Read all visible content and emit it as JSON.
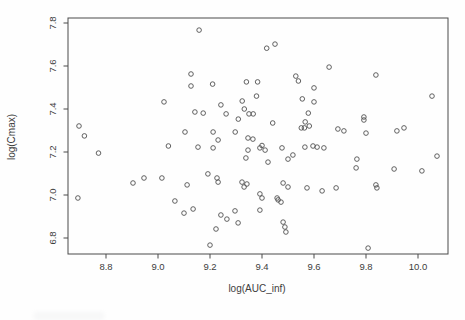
{
  "chart_data": {
    "type": "scatter",
    "title": "",
    "xlabel": "log(AUC_inf)",
    "ylabel": "log(Cmax)",
    "x_ticks": [
      8.8,
      9.0,
      9.2,
      9.4,
      9.6,
      9.8,
      10.0
    ],
    "y_ticks": [
      6.8,
      7.0,
      7.2,
      7.4,
      7.6,
      7.8
    ],
    "xlim": [
      8.65,
      10.11
    ],
    "ylim": [
      6.72,
      7.82
    ],
    "grid": false,
    "legend": "none",
    "marker": "open-circle",
    "marker_color": "#4f4f4f",
    "axis_color": "#4a4a4a",
    "background_color": "#fefefe",
    "points": [
      [
        8.692,
        6.986
      ],
      [
        8.696,
        7.321
      ],
      [
        8.717,
        7.275
      ],
      [
        8.771,
        7.195
      ],
      [
        8.904,
        7.056
      ],
      [
        8.946,
        7.079
      ],
      [
        9.015,
        7.079
      ],
      [
        9.023,
        7.433
      ],
      [
        9.04,
        7.228
      ],
      [
        9.065,
        6.972
      ],
      [
        9.1,
        6.916
      ],
      [
        9.104,
        7.293
      ],
      [
        9.112,
        7.047
      ],
      [
        9.127,
        7.563
      ],
      [
        9.127,
        7.507
      ],
      [
        9.135,
        6.935
      ],
      [
        9.142,
        7.386
      ],
      [
        9.154,
        7.223
      ],
      [
        9.158,
        7.767
      ],
      [
        9.174,
        7.381
      ],
      [
        9.192,
        7.098
      ],
      [
        9.2,
        6.767
      ],
      [
        9.21,
        7.516
      ],
      [
        9.212,
        7.219
      ],
      [
        9.212,
        7.293
      ],
      [
        9.223,
        6.842
      ],
      [
        9.227,
        7.079
      ],
      [
        9.231,
        7.256
      ],
      [
        9.231,
        7.06
      ],
      [
        9.242,
        7.419
      ],
      [
        9.242,
        6.907
      ],
      [
        9.262,
        7.377
      ],
      [
        9.265,
        6.888
      ],
      [
        9.296,
        6.926
      ],
      [
        9.297,
        7.293
      ],
      [
        9.308,
        6.87
      ],
      [
        9.309,
        7.353
      ],
      [
        9.323,
        7.06
      ],
      [
        9.324,
        7.437
      ],
      [
        9.331,
        7.037
      ],
      [
        9.332,
        7.4
      ],
      [
        9.338,
        7.172
      ],
      [
        9.34,
        7.526
      ],
      [
        9.342,
        7.051
      ],
      [
        9.346,
        7.265
      ],
      [
        9.346,
        7.209
      ],
      [
        9.35,
        7.377
      ],
      [
        9.365,
        7.26
      ],
      [
        9.366,
        7.377
      ],
      [
        9.379,
        7.46
      ],
      [
        9.383,
        7.526
      ],
      [
        9.392,
        7.219
      ],
      [
        9.392,
        7.005
      ],
      [
        9.392,
        6.93
      ],
      [
        9.4,
        7.23
      ],
      [
        9.4,
        6.986
      ],
      [
        9.412,
        7.209
      ],
      [
        9.418,
        7.683
      ],
      [
        9.423,
        7.153
      ],
      [
        9.441,
        7.335
      ],
      [
        9.45,
        7.702
      ],
      [
        9.458,
        6.986
      ],
      [
        9.462,
        6.977
      ],
      [
        9.473,
        6.967
      ],
      [
        9.477,
        7.219
      ],
      [
        9.481,
        7.056
      ],
      [
        9.481,
        6.874
      ],
      [
        9.488,
        6.851
      ],
      [
        9.492,
        6.828
      ],
      [
        9.5,
        7.167
      ],
      [
        9.5,
        7.037
      ],
      [
        9.519,
        7.186
      ],
      [
        9.53,
        7.553
      ],
      [
        9.54,
        7.53
      ],
      [
        9.551,
        7.312
      ],
      [
        9.555,
        7.447
      ],
      [
        9.563,
        7.312
      ],
      [
        9.565,
        7.223
      ],
      [
        9.566,
        7.34
      ],
      [
        9.573,
        7.033
      ],
      [
        9.578,
        7.381
      ],
      [
        9.582,
        7.321
      ],
      [
        9.596,
        7.228
      ],
      [
        9.6,
        7.498
      ],
      [
        9.6,
        7.433
      ],
      [
        9.612,
        7.223
      ],
      [
        9.631,
        7.019
      ],
      [
        9.638,
        7.219
      ],
      [
        9.658,
        7.595
      ],
      [
        9.685,
        7.033
      ],
      [
        9.692,
        7.307
      ],
      [
        9.715,
        7.298
      ],
      [
        9.762,
        7.126
      ],
      [
        9.765,
        7.167
      ],
      [
        9.792,
        7.363
      ],
      [
        9.792,
        7.349
      ],
      [
        9.8,
        7.288
      ],
      [
        9.808,
        6.753
      ],
      [
        9.838,
        7.558
      ],
      [
        9.838,
        7.047
      ],
      [
        9.842,
        7.033
      ],
      [
        9.908,
        7.121
      ],
      [
        9.919,
        7.298
      ],
      [
        9.946,
        7.312
      ],
      [
        10.015,
        7.112
      ],
      [
        10.054,
        7.46
      ],
      [
        10.073,
        7.181
      ]
    ]
  }
}
